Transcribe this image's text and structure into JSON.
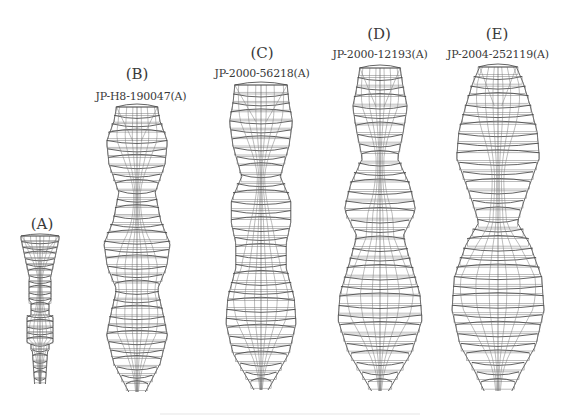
{
  "figure": {
    "designs": [
      {
        "id": "A",
        "letter": "(A)",
        "patent": "",
        "left": 20,
        "top": 236,
        "width": 40,
        "height": 148,
        "maxw": 36,
        "profile": "small"
      },
      {
        "id": "B",
        "letter": "(B)",
        "patent": "JP-H8-190047(A)",
        "left": 104,
        "top": 107,
        "width": 66,
        "height": 285,
        "maxw": 62,
        "profile": "B"
      },
      {
        "id": "C",
        "letter": "(C)",
        "patent": "JP-2000-56218(A)",
        "left": 226,
        "top": 85,
        "width": 70,
        "height": 305,
        "maxw": 66,
        "profile": "C"
      },
      {
        "id": "D",
        "letter": "(D)",
        "patent": "JP-2000-12193(A)",
        "left": 338,
        "top": 68,
        "width": 84,
        "height": 323,
        "maxw": 78,
        "profile": "D"
      },
      {
        "id": "E",
        "letter": "(E)",
        "patent": "JP-2004-252119(A)",
        "left": 452,
        "top": 67,
        "width": 92,
        "height": 324,
        "maxw": 88,
        "profile": "E"
      }
    ]
  },
  "labels": {
    "A": {
      "letter": "(A)",
      "patent": ""
    },
    "B": {
      "letter": "(B)",
      "patent": "JP-H8-190047(A)"
    },
    "C": {
      "letter": "(C)",
      "patent": "JP-2000-56218(A)"
    },
    "D": {
      "letter": "(D)",
      "patent": "JP-2000-12193(A)"
    },
    "E": {
      "letter": "(E)",
      "patent": "JP-2004-252119(A)"
    }
  },
  "colors": {
    "line": "#3c3c3c",
    "text": "#3a3a3a",
    "background": "#ffffff"
  }
}
